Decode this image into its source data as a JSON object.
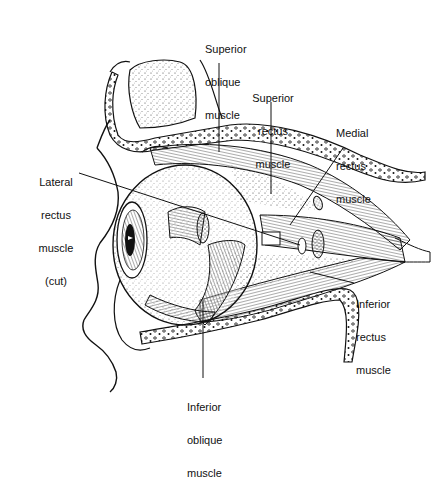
{
  "diagram": {
    "labels": {
      "superior_oblique": [
        "Superior",
        "oblique",
        "muscle"
      ],
      "superior_rectus": [
        "Superior",
        "rectus",
        "muscle"
      ],
      "medial_rectus": [
        "Medial",
        "rectus",
        "muscle"
      ],
      "lateral_rectus": [
        "Lateral",
        "rectus",
        "muscle",
        "(cut)"
      ],
      "inferior_rectus": [
        "Inferior",
        "rectus",
        "muscle"
      ],
      "inferior_oblique": [
        "Inferior",
        "oblique",
        "muscle"
      ]
    },
    "colors": {
      "ink": "#111111",
      "paper": "#ffffff"
    }
  }
}
